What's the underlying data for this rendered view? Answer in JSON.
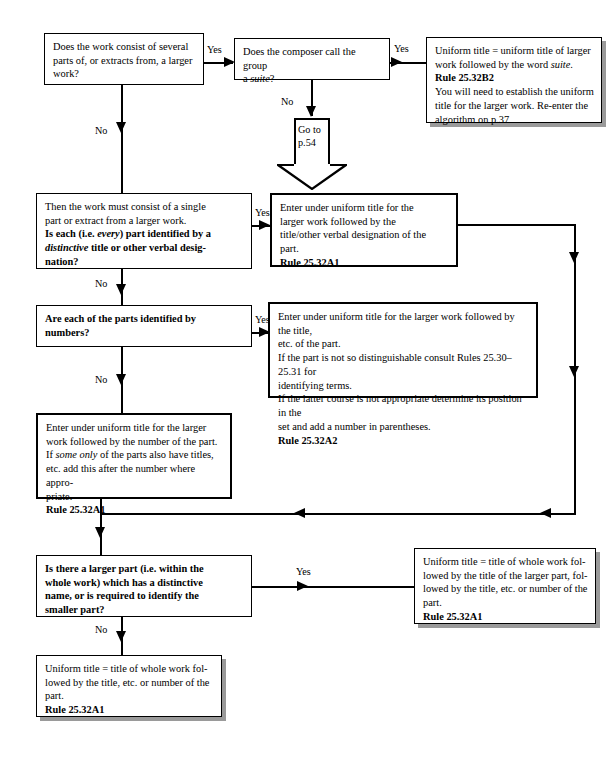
{
  "document": {
    "title": "Uniform title decision flowchart (AACR2 Rule 25.32)"
  },
  "nodes": {
    "q1": {
      "name": "question-several-parts",
      "line1": "Does the work consist of several",
      "line2": "parts of, or extracts from, a larger",
      "line3": "work?"
    },
    "q2": {
      "name": "question-composer-suite",
      "line1": "Does the composer call the group",
      "line2_pre": "a ",
      "line2_ital": "suite",
      "line2_post": "?"
    },
    "r1": {
      "name": "result-uniform-title-suite",
      "line1": "Uniform title = uniform title of larger",
      "line2_pre": "work followed by the word ",
      "line2_ital": "suite",
      "line2_post": ".",
      "rule": "Rule 25.32B2",
      "line3": "You will need to establish the uniform",
      "line4": "title for the larger work. Re-enter the",
      "line5": "algorithm on p.37"
    },
    "goto": {
      "name": "goto-page-54",
      "line1": "Go to",
      "line2": "p.54"
    },
    "q3": {
      "name": "question-distinctive-title",
      "line1": "Then the work must consist of a single",
      "line2": "part or extract from a larger work.",
      "line3_pre": "Is each (i.e. ",
      "line3_ital": "every",
      "line3_post": ") part identified by a",
      "line4_ital": "distinctive",
      "line4_post": " title or other verbal desig-",
      "line5": "nation?"
    },
    "r2": {
      "name": "result-uniform-title-verbal-designation",
      "line1": "Enter under uniform title for the",
      "line2": "larger work followed by the",
      "line3": "title/other verbal designation of the",
      "line4": "part.",
      "rule": "Rule 25.32A1"
    },
    "q4": {
      "name": "question-parts-numbers",
      "line1": "Are each of the parts identified by",
      "line2": "numbers?"
    },
    "r3": {
      "name": "result-uniform-title-numbers",
      "line1": "Enter under uniform title for the larger work followed by the title,",
      "line2": "etc. of the part.",
      "line3": "If the part is not so distinguishable consult Rules 25.30–25.31 for",
      "line4": "identifying terms.",
      "line5": "If the latter course is not appropriate determine its position in the",
      "line6": "set and add a number in parentheses.",
      "rule": "Rule 25.32A2"
    },
    "r4": {
      "name": "result-uniform-title-part-number",
      "line1": "Enter under uniform title for the larger",
      "line2": "work followed by the number of the part.",
      "line3_pre": "If ",
      "line3_ital": "some only",
      "line3_post": " of the parts also have titles,",
      "line4": "etc. add this after the number where appro-",
      "line5": "priate.",
      "rule": "Rule 25.32A1"
    },
    "q5": {
      "name": "question-larger-part",
      "line1": "Is there a larger part (i.e. within the",
      "line2": "whole work) which has a distinctive",
      "line3": "name, or is required to identify the",
      "line4": "smaller part?"
    },
    "r5": {
      "name": "result-whole-work-larger-part",
      "line1": "Uniform title = title of whole work fol-",
      "line2": "lowed by the title of the larger part, fol-",
      "line3": "lowed by the title, etc. or number of the",
      "line4": "part.",
      "rule": "Rule 25.32A1"
    },
    "r6": {
      "name": "result-whole-work-title",
      "line1": "Uniform title = title of whole work fol-",
      "line2": "lowed by the title, etc. or number of the",
      "line3": "part.",
      "rule": "Rule 25.32A1"
    }
  },
  "edges": {
    "yes1": "Yes",
    "yes2": "Yes",
    "yes3": "Yes",
    "yes4": "Yes",
    "yes5": "Yes",
    "no1": "No",
    "no2": "No",
    "no3": "No",
    "no4": "No",
    "no5": "No"
  },
  "colors": {
    "line": "#000000",
    "box_border": "#000000",
    "shadow": "#9a9a9a",
    "background": "#ffffff"
  }
}
